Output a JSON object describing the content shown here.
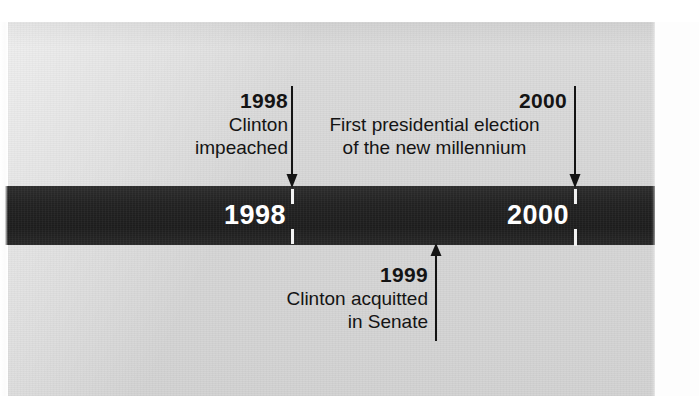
{
  "graphic": {
    "type": "historical-timeline",
    "colors": {
      "bar": "#242424",
      "bar_label": "#ffffff",
      "paper": "#d7d7d7",
      "text": "#141414"
    }
  },
  "bar_labels": [
    {
      "year": "1998"
    },
    {
      "year": "2000"
    }
  ],
  "callouts": [
    {
      "year": "1998",
      "line1": "Clinton",
      "line2": "impeached",
      "position": "above",
      "arrow": "down-arrow-icon"
    },
    {
      "year": "2000",
      "line1": "First presidential election",
      "line2": "of the new millennium",
      "position": "above",
      "arrow": "down-arrow-icon"
    },
    {
      "year": "1999",
      "line1": "Clinton acquitted",
      "line2": "in Senate",
      "position": "below",
      "arrow": "up-arrow-icon"
    }
  ]
}
